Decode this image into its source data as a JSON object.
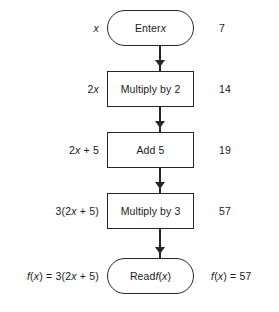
{
  "diagram": {
    "input_value": "7",
    "line_color": "#262626",
    "background": "#ffffff",
    "columns": {
      "expression_header": "expression",
      "shape_header": "operation",
      "value_header": "value"
    },
    "steps": [
      {
        "id": "enter",
        "shape": "terminal",
        "expression": "x",
        "label": "Enter x",
        "value": "7"
      },
      {
        "id": "multiply-by-2",
        "shape": "process",
        "expression": "2x",
        "label": "Multiply by 2",
        "value": "14"
      },
      {
        "id": "add-5",
        "shape": "process",
        "expression": "2x + 5",
        "label": "Add 5",
        "value": "19"
      },
      {
        "id": "multiply-by-3",
        "shape": "process",
        "expression": "3(2x + 5)",
        "label": "Multiply by 3",
        "value": "57"
      },
      {
        "id": "read",
        "shape": "terminal",
        "expression": "f(x)  =  3(2x + 5)",
        "label": "Read f(x)",
        "value": "f(x)  =  57"
      }
    ],
    "connectors": [
      {
        "from": "enter",
        "to": "multiply-by-2",
        "head": "solid-triangle"
      },
      {
        "from": "multiply-by-2",
        "to": "add-5",
        "head": "solid-triangle"
      },
      {
        "from": "add-5",
        "to": "multiply-by-3",
        "head": "solid-triangle"
      },
      {
        "from": "multiply-by-3",
        "to": "read",
        "head": "solid-triangle"
      }
    ]
  }
}
